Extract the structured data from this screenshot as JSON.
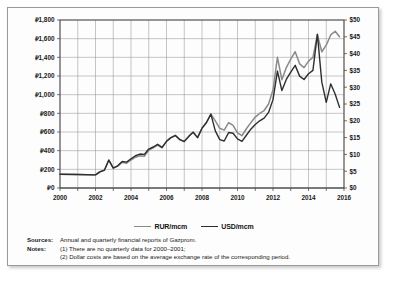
{
  "chart_data": {
    "type": "line",
    "title": "",
    "xlabel": "",
    "ylabel": "RUR per mcm",
    "y2label": "USD per mcm",
    "xlim": [
      2000,
      2016
    ],
    "ylim": [
      0,
      1800
    ],
    "y2lim": [
      0,
      50
    ],
    "grid": true,
    "legend_position": "bottom-center",
    "x_ticks": [
      "2000",
      "2002",
      "2004",
      "2006",
      "2008",
      "2010",
      "2012",
      "2014",
      "2016"
    ],
    "y_ticks": [
      "₽0",
      "₽200",
      "₽400",
      "₽600",
      "₽800",
      "₽1,000",
      "₽1,200",
      "₽1,400",
      "₽1,600",
      "₽1,800"
    ],
    "y2_ticks": [
      "$0",
      "$5",
      "$10",
      "$15",
      "$20",
      "$25",
      "$30",
      "$35",
      "$40",
      "$45",
      "$50"
    ],
    "series": [
      {
        "name": "RUR/mcm",
        "color": "#8a8a8a",
        "axis": "left",
        "x": [
          2000.0,
          2001.0,
          2002.0,
          2002.25,
          2002.5,
          2002.75,
          2003.0,
          2003.25,
          2003.5,
          2003.75,
          2004.0,
          2004.25,
          2004.5,
          2004.75,
          2005.0,
          2005.25,
          2005.5,
          2005.75,
          2006.0,
          2006.25,
          2006.5,
          2006.75,
          2007.0,
          2007.25,
          2007.5,
          2007.75,
          2008.0,
          2008.25,
          2008.5,
          2008.75,
          2009.0,
          2009.25,
          2009.5,
          2009.75,
          2010.0,
          2010.25,
          2010.5,
          2010.75,
          2011.0,
          2011.25,
          2011.5,
          2011.75,
          2012.0,
          2012.25,
          2012.5,
          2012.75,
          2013.0,
          2013.25,
          2013.5,
          2013.75,
          2014.0,
          2014.25,
          2014.5,
          2014.75,
          2015.0,
          2015.25,
          2015.5,
          2015.75
        ],
        "values": [
          148,
          145,
          140,
          175,
          190,
          300,
          215,
          235,
          275,
          265,
          300,
          330,
          345,
          340,
          405,
          430,
          460,
          430,
          500,
          540,
          565,
          520,
          500,
          555,
          600,
          540,
          640,
          700,
          790,
          720,
          640,
          620,
          700,
          670,
          590,
          560,
          635,
          700,
          760,
          800,
          830,
          900,
          1050,
          1400,
          1160,
          1290,
          1380,
          1460,
          1330,
          1290,
          1360,
          1400,
          1640,
          1460,
          1530,
          1640,
          1680,
          1620
        ]
      },
      {
        "name": "USD/mcm",
        "color": "#2e2e2e",
        "axis": "right",
        "x": [
          2000.0,
          2001.0,
          2002.0,
          2002.25,
          2002.5,
          2002.75,
          2003.0,
          2003.25,
          2003.5,
          2003.75,
          2004.0,
          2004.25,
          2004.5,
          2004.75,
          2005.0,
          2005.25,
          2005.5,
          2005.75,
          2006.0,
          2006.25,
          2006.5,
          2006.75,
          2007.0,
          2007.25,
          2007.5,
          2007.75,
          2008.0,
          2008.25,
          2008.5,
          2008.75,
          2009.0,
          2009.25,
          2009.5,
          2009.75,
          2010.0,
          2010.25,
          2010.5,
          2010.75,
          2011.0,
          2011.25,
          2011.5,
          2011.75,
          2012.0,
          2012.25,
          2012.5,
          2012.75,
          2013.0,
          2013.25,
          2013.5,
          2013.75,
          2014.0,
          2014.25,
          2014.5,
          2014.75,
          2015.0,
          2015.25,
          2015.5,
          2015.75
        ],
        "values": [
          4.1,
          4.0,
          3.9,
          4.8,
          5.3,
          8.3,
          5.9,
          6.6,
          7.9,
          7.7,
          8.7,
          9.6,
          10.1,
          10.0,
          11.6,
          12.2,
          13.0,
          12.1,
          13.9,
          15.0,
          15.6,
          14.4,
          13.8,
          15.3,
          16.6,
          15.0,
          17.8,
          19.5,
          22.0,
          17.0,
          14.4,
          14.0,
          16.5,
          16.3,
          14.6,
          13.9,
          15.7,
          17.5,
          18.9,
          20.0,
          20.8,
          22.5,
          26.3,
          34.8,
          29.0,
          32.3,
          34.5,
          36.5,
          33.3,
          32.3,
          34.0,
          35.0,
          45.8,
          31.5,
          25.5,
          31.0,
          28.0,
          24.0
        ]
      }
    ]
  },
  "legend": {
    "items": [
      {
        "label": "RUR/mcm"
      },
      {
        "label": "USD/mcm"
      }
    ]
  },
  "notes": {
    "sources_key": "Sources:",
    "sources_value": "Annual and quarterly financial reports of Gazprom.",
    "notes_key": "Notes:",
    "note_1": "(1) There are no quarterly data for 2000–2001;",
    "note_2": "(2) Dollar costs are based on the average exchange rate of the corresponding period."
  }
}
